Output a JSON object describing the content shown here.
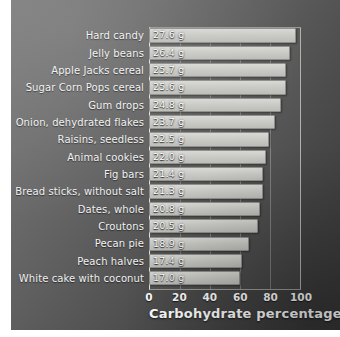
{
  "chart_data": {
    "type": "bar",
    "orientation": "horizontal",
    "title": "",
    "xlabel": "Carbohydrate percentage",
    "ylabel": "",
    "xlim": [
      0,
      100
    ],
    "xticks": [
      0,
      20,
      40,
      60,
      80,
      100
    ],
    "xtick_labels": [
      "0",
      "20",
      "40",
      "60",
      "80",
      "100"
    ],
    "grid": true,
    "legend": null,
    "value_unit": "g",
    "categories": [
      "Hard candy",
      "Jelly beans",
      "Apple Jacks cereal",
      "Sugar Corn Pops cereal",
      "Gum drops",
      "Onion, dehydrated flakes",
      "Raisins, seedless",
      "Animal cookies",
      "Fig bars",
      "Bread sticks, without salt",
      "Dates, whole",
      "Croutons",
      "Pecan pie",
      "Peach halves",
      "White cake with coconut"
    ],
    "values": [
      27.6,
      26.4,
      25.7,
      25.6,
      24.8,
      23.7,
      22.5,
      22.0,
      21.4,
      21.3,
      20.8,
      20.5,
      18.9,
      17.4,
      17.0
    ],
    "bar_percentages": [
      97,
      93,
      90,
      90,
      87,
      83,
      79,
      77,
      75,
      75,
      73,
      72,
      66,
      61,
      60
    ],
    "data_labels": [
      "27.6 g",
      "26.4 g",
      "25.7 g",
      "25.6 g",
      "24.8 g",
      "23.7 g",
      "22.5 g",
      "22.0 g",
      "21.4 g",
      "21.3 g",
      "20.8 g",
      "20.5 g",
      "18.9 g",
      "17.4 g",
      "17.0 g"
    ],
    "rows": [
      {
        "label": "Hard candy",
        "value": 27.6,
        "data_label": "27.6 g",
        "pct": 97
      },
      {
        "label": "Jelly beans",
        "value": 26.4,
        "data_label": "26.4 g",
        "pct": 93
      },
      {
        "label": "Apple Jacks cereal",
        "value": 25.7,
        "data_label": "25.7 g",
        "pct": 90
      },
      {
        "label": "Sugar Corn Pops cereal",
        "value": 25.6,
        "data_label": "25.6 g",
        "pct": 90
      },
      {
        "label": "Gum drops",
        "value": 24.8,
        "data_label": "24.8 g",
        "pct": 87
      },
      {
        "label": "Onion, dehydrated flakes",
        "value": 23.7,
        "data_label": "23.7 g",
        "pct": 83
      },
      {
        "label": "Raisins, seedless",
        "value": 22.5,
        "data_label": "22.5 g",
        "pct": 79
      },
      {
        "label": "Animal cookies",
        "value": 22.0,
        "data_label": "22.0 g",
        "pct": 77
      },
      {
        "label": "Fig bars",
        "value": 21.4,
        "data_label": "21.4 g",
        "pct": 75
      },
      {
        "label": "Bread sticks, without salt",
        "value": 21.3,
        "data_label": "21.3 g",
        "pct": 75
      },
      {
        "label": "Dates, whole",
        "value": 20.8,
        "data_label": "20.8 g",
        "pct": 73
      },
      {
        "label": "Croutons",
        "value": 20.5,
        "data_label": "20.5 g",
        "pct": 72
      },
      {
        "label": "Pecan pie",
        "value": 18.9,
        "data_label": "18.9 g",
        "pct": 66
      },
      {
        "label": "Peach halves",
        "value": 17.4,
        "data_label": "17.4 g",
        "pct": 61
      },
      {
        "label": "White cake with coconut",
        "value": 17.0,
        "data_label": "17.0 g",
        "pct": 60
      }
    ]
  },
  "colors": {
    "background_light": "#7c7c7c",
    "background_dark": "#353535",
    "bar_fill": "#c9c9c5",
    "bar_edge": "#8f8f8c",
    "text": "#ffffff",
    "gridline": "#ebebe6"
  }
}
